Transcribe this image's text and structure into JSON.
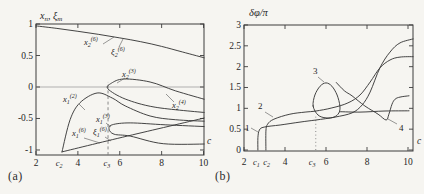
{
  "figure": {
    "background": "#f6f5f1",
    "caption_a": "(a)",
    "caption_b": "(b)",
    "axis_color": "#3c3c3c",
    "curve_color": "#3a3a3a",
    "zero_line_color": "#a8a8a8",
    "dashed_color": "#7e7e7e",
    "text_color": "#262626"
  },
  "chart_data": [
    {
      "id": "a",
      "type": "line",
      "title": "",
      "xlabel": "c",
      "ylabel_parts": [
        {
          "t": "x",
          "sub": "n"
        },
        {
          "t": ", ξ",
          "sub": "m"
        }
      ],
      "xlim": [
        2,
        10.2
      ],
      "ylim": [
        -1.08,
        1.0
      ],
      "grid": false,
      "legend": "none",
      "xticks": {
        "values": [
          2,
          4,
          6,
          8,
          10
        ],
        "labels": [
          "2",
          "4",
          "6",
          "8",
          "10"
        ]
      },
      "yticks": {
        "values": [
          1,
          0.5,
          0,
          -0.5,
          -1
        ],
        "labels": [
          "1",
          "0.5",
          "0",
          "-0.5",
          "-1"
        ]
      },
      "special_xticks": [
        {
          "t": "c",
          "sub": "2",
          "value": 3.1
        },
        {
          "t": "c",
          "sub": "3",
          "value": 5.38
        }
      ],
      "zero_line": true,
      "vline": {
        "style": "dashed",
        "x": 5.44,
        "y0": -1.08,
        "y1": 0.08
      },
      "series": [
        {
          "name": "x2(6), xi2(6) upper branch",
          "points": [
            [
              2,
              0.97
            ],
            [
              3,
              0.93
            ],
            [
              4,
              0.885
            ],
            [
              5,
              0.835
            ],
            [
              6,
              0.78
            ],
            [
              7,
              0.72
            ],
            [
              8,
              0.645
            ],
            [
              9,
              0.555
            ],
            [
              10.2,
              0.45
            ]
          ]
        },
        {
          "name": "x2(3)-x2(4) folded branch",
          "points": [
            [
              10.2,
              -0.21
            ],
            [
              8.65,
              -0.06
            ],
            [
              7.45,
              0.08
            ],
            [
              6.2,
              0.127
            ],
            [
              5.6,
              0.06
            ],
            [
              5.44,
              -0.03
            ],
            [
              6.26,
              -0.19
            ],
            [
              7.69,
              -0.32
            ],
            [
              10.2,
              -0.41
            ]
          ]
        },
        {
          "name": "x1(2) hump branch",
          "points": [
            [
              3.24,
              -1.03
            ],
            [
              3.63,
              -0.52
            ],
            [
              4.1,
              -0.25
            ],
            [
              4.92,
              -0.095
            ],
            [
              5.64,
              -0.175
            ],
            [
              6.26,
              -0.3
            ],
            [
              7.45,
              -0.46
            ],
            [
              8.65,
              -0.52
            ],
            [
              10.2,
              -0.545
            ]
          ]
        },
        {
          "name": "x1(3)-x1(4) folded branch",
          "points": [
            [
              10.2,
              -0.63
            ],
            [
              8.17,
              -0.6
            ],
            [
              6.5,
              -0.57
            ],
            [
              5.64,
              -0.6
            ],
            [
              5.49,
              -0.67
            ],
            [
              5.73,
              -0.75
            ],
            [
              6.5,
              -0.78
            ],
            [
              8.08,
              -0.9
            ],
            [
              10.2,
              -0.905
            ]
          ]
        },
        {
          "name": "x1(6), xi1(6) diagonal branch",
          "points": [
            [
              3.24,
              -1.03
            ],
            [
              6.6,
              -0.76
            ],
            [
              10.2,
              -0.48
            ]
          ]
        }
      ],
      "curve_labels": [
        {
          "t": "x",
          "sub": "2",
          "sup": "(6)",
          "px": [
            84,
            45
          ],
          "line": [
            [
              103,
              44
            ],
            [
              114,
              37
            ]
          ]
        },
        {
          "t": "ξ",
          "sub": "2",
          "sup": "(6)",
          "px": [
            111,
            55
          ],
          "line": [
            [
              119,
              47
            ],
            [
              123,
              39
            ]
          ]
        },
        {
          "t": "x",
          "sub": "2",
          "sup": "(3)",
          "px": [
            122,
            77
          ],
          "line": [
            [
              125,
              78
            ],
            [
              117,
              83
            ]
          ]
        },
        {
          "t": "x",
          "sub": "2",
          "sup": "(4)",
          "px": [
            172,
            108
          ],
          "line": [
            [
              174,
              102
            ],
            [
              166,
              94
            ]
          ]
        },
        {
          "t": "x",
          "sub": "1",
          "sup": "(2)",
          "px": [
            63,
            102
          ],
          "line": [
            [
              79,
              104
            ],
            [
              85,
              110
            ]
          ]
        },
        {
          "t": "x",
          "sub": "1",
          "sup": "(3)",
          "px": [
            96,
            122
          ],
          "line": [
            [
              106,
              123
            ],
            [
              111,
              127
            ]
          ]
        },
        {
          "t": "x",
          "sub": "1",
          "sup": "(6)",
          "px": [
            72,
            136
          ],
          "line": [
            [
              84,
              138
            ],
            [
              100,
              143
            ]
          ]
        },
        {
          "t": "ξ",
          "sub": "1",
          "sup": "(6)",
          "px": [
            93,
            135
          ],
          "line": [
            [
              105,
              137
            ],
            [
              111,
              141
            ]
          ]
        }
      ]
    },
    {
      "id": "b",
      "type": "line",
      "title": "",
      "xlabel": "c",
      "ylabel": "δφ/π",
      "xlim": [
        2,
        10.24
      ],
      "ylim": [
        0,
        3.02
      ],
      "grid": false,
      "legend": "none",
      "xticks": {
        "values": [
          2,
          4,
          6,
          8,
          10
        ],
        "labels": [
          "2",
          "4",
          "6",
          "8",
          "10"
        ]
      },
      "yticks": {
        "values": [
          3,
          2.5,
          2,
          1.5,
          1,
          0.5,
          0
        ],
        "labels": [
          "3",
          "2.5",
          "2",
          "1.5",
          "1",
          "0.5",
          "0"
        ]
      },
      "special_xticks": [
        {
          "t": "c",
          "sub": "1",
          "value": 2.6
        },
        {
          "t": "c",
          "sub": "2",
          "value": 3.1
        },
        {
          "t": "c",
          "sub": "3",
          "value": 5.32
        }
      ],
      "zero_line": false,
      "vline": {
        "style": "dotted",
        "x": 5.5,
        "y0": 0,
        "y1": 0.8
      },
      "series": [
        {
          "name": "curve 1",
          "points": [
            [
              2.68,
              0
            ],
            [
              2.68,
              0.3
            ],
            [
              2.75,
              0.48
            ],
            [
              2.98,
              0.55
            ],
            [
              3.76,
              0.6
            ],
            [
              4.73,
              0.67
            ],
            [
              5.51,
              0.72
            ],
            [
              6.44,
              0.79
            ],
            [
              7.27,
              0.89
            ],
            [
              7.76,
              1.08
            ],
            [
              8.15,
              1.39
            ],
            [
              8.63,
              1.97
            ],
            [
              9.12,
              2.35
            ],
            [
              9.61,
              2.57
            ],
            [
              10.3,
              2.67
            ]
          ]
        },
        {
          "name": "curve 2",
          "points": [
            [
              3.07,
              0
            ],
            [
              3.07,
              0.45
            ],
            [
              3.15,
              0.62
            ],
            [
              3.46,
              0.74
            ],
            [
              4.24,
              0.86
            ],
            [
              4.98,
              0.91
            ],
            [
              5.51,
              0.935
            ],
            [
              6.29,
              1.01
            ],
            [
              7.07,
              1.13
            ],
            [
              7.66,
              1.32
            ],
            [
              8.15,
              1.63
            ],
            [
              8.63,
              1.97
            ],
            [
              9.12,
              2.16
            ],
            [
              9.61,
              2.23
            ],
            [
              10.3,
              2.24
            ]
          ]
        },
        {
          "name": "curve 3 loop",
          "closed": true,
          "points": [
            [
              5.37,
              1.055
            ],
            [
              5.46,
              1.32
            ],
            [
              5.71,
              1.53
            ],
            [
              6.0,
              1.61
            ],
            [
              6.29,
              1.53
            ],
            [
              6.54,
              1.32
            ],
            [
              6.68,
              1.055
            ],
            [
              6.63,
              0.89
            ],
            [
              6.39,
              0.79
            ],
            [
              6.0,
              0.77
            ],
            [
              5.61,
              0.84
            ]
          ]
        },
        {
          "name": "curve 3 flat branch",
          "points": [
            [
              6.66,
              0.92
            ],
            [
              7.66,
              0.91
            ],
            [
              8.88,
              0.935
            ],
            [
              10.05,
              0.94
            ]
          ]
        },
        {
          "name": "curve 4",
          "points": [
            [
              6.5,
              1.62
            ],
            [
              6.9,
              1.42
            ],
            [
              7.27,
              1.3
            ],
            [
              7.9,
              1.055
            ],
            [
              8.54,
              0.86
            ],
            [
              8.93,
              0.72
            ],
            [
              9.07,
              0.86
            ],
            [
              9.22,
              1.1
            ],
            [
              9.37,
              1.22
            ],
            [
              9.61,
              1.27
            ],
            [
              10.05,
              1.3
            ]
          ]
        }
      ],
      "curve_labels": [
        {
          "t": "1",
          "upright": true,
          "px": [
            245,
            131
          ],
          "line": [
            [
              251,
              128
            ],
            [
              258,
              132
            ]
          ]
        },
        {
          "t": "2",
          "upright": true,
          "px": [
            258,
            109
          ],
          "line": [
            [
              265,
              112
            ],
            [
              273,
              117
            ]
          ]
        },
        {
          "t": "3",
          "upright": true,
          "px": [
            313,
            74
          ],
          "line": [
            [
              318,
              77
            ],
            [
              324,
              82
            ]
          ]
        },
        {
          "t": "4",
          "upright": true,
          "px": [
            399,
            131
          ],
          "line": [
            [
              397,
              124
            ],
            [
              388,
              119
            ]
          ]
        }
      ]
    }
  ]
}
